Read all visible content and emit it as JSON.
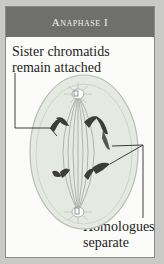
{
  "header": {
    "title": "Anaphase I"
  },
  "labels": {
    "top_line1": "Sister chromatids",
    "top_line2": "remain attached",
    "bottom_line1": "Homologues",
    "bottom_line2": "separate"
  },
  "colors": {
    "background": "#c9c9c7",
    "header": "#6f6f6d",
    "cell_fill": "#e3e8e1",
    "chromosome": "#3a3a38"
  }
}
